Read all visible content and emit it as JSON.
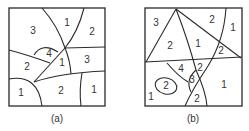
{
  "figure": {
    "panels": [
      {
        "id": "a",
        "caption": "(a)",
        "region_labels": [
          "3",
          "1",
          "2",
          "4",
          "2",
          "1",
          "3",
          "1",
          "2",
          "1"
        ]
      },
      {
        "id": "b",
        "caption": "(b)",
        "region_labels": [
          "3",
          "2",
          "1",
          "2",
          "1",
          "2",
          "4",
          "2",
          "3",
          "2",
          "1",
          "1",
          "2"
        ]
      }
    ],
    "colors": {
      "line": "#2a2a2a",
      "text": "#333333",
      "background": "#ffffff"
    }
  }
}
